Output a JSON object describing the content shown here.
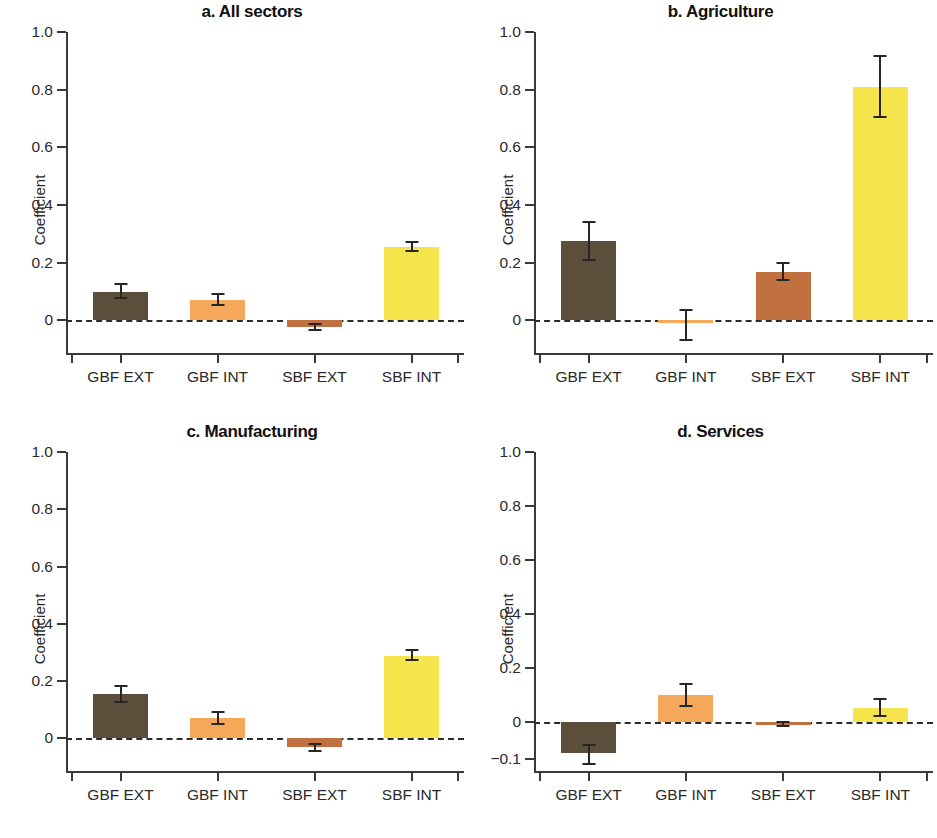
{
  "figure": {
    "ylabel": "Coefficient",
    "categories": [
      "GBF EXT",
      "GBF INT",
      "SBF EXT",
      "SBF INT"
    ],
    "colors": {
      "GBF EXT": "#5B4F3C",
      "GBF INT": "#F5A85A",
      "SBF EXT": "#C1713F",
      "SBF INT": "#F5E44C"
    }
  },
  "panels": [
    {
      "title": "a. All sectors",
      "ylabel": "Coefficient",
      "yticks": [
        "1.0",
        "0.8",
        "0.6",
        "0.4",
        "0.2",
        "0"
      ],
      "ytick_values": [
        1.0,
        0.8,
        0.6,
        0.4,
        0.2,
        0
      ],
      "ylim": [
        -0.06,
        1.0
      ]
    },
    {
      "title": "b. Agriculture",
      "ylabel": "Coefficient",
      "yticks": [
        "1.0",
        "0.8",
        "0.6",
        "0.4",
        "0.2",
        "0"
      ],
      "ytick_values": [
        1.0,
        0.8,
        0.6,
        0.4,
        0.2,
        0
      ],
      "ylim": [
        -0.085,
        1.0
      ]
    },
    {
      "title": "c. Manufacturing",
      "ylabel": "Coefficient",
      "yticks": [
        "1.0",
        "0.8",
        "0.6",
        "0.4",
        "0.2",
        "0"
      ],
      "ytick_values": [
        1.0,
        0.8,
        0.6,
        0.4,
        0.2,
        0
      ],
      "ylim": [
        -0.06,
        1.0
      ]
    },
    {
      "title": "d. Services",
      "ylabel": "Coefficient",
      "yticks": [
        "1.0",
        "0.8",
        "0.6",
        "0.4",
        "0.2",
        "0",
        "−0.1"
      ],
      "ytick_values": [
        1.0,
        0.8,
        0.6,
        0.4,
        0.2,
        0,
        -0.1
      ],
      "ylim": [
        -0.135,
        1.0
      ]
    }
  ],
  "chart_data": [
    {
      "type": "bar",
      "title": "a. All sectors",
      "xlabel": "",
      "ylabel": "Coefficient",
      "ylim": [
        -0.06,
        1.0
      ],
      "ytick_values": [
        1.0,
        0.8,
        0.6,
        0.4,
        0.2,
        0
      ],
      "grid": false,
      "legend": "none",
      "categories": [
        "GBF EXT",
        "GBF INT",
        "SBF EXT",
        "SBF INT"
      ],
      "values": [
        0.099,
        0.071,
        -0.012,
        0.255
      ],
      "errors_low": [
        0.076,
        0.054,
        -0.018,
        0.24
      ],
      "errors_high": [
        0.126,
        0.09,
        -0.006,
        0.271
      ]
    },
    {
      "type": "bar",
      "title": "b. Agriculture",
      "xlabel": "",
      "ylabel": "Coefficient",
      "ylim": [
        -0.085,
        1.0
      ],
      "ytick_values": [
        1.0,
        0.8,
        0.6,
        0.4,
        0.2,
        0
      ],
      "grid": false,
      "legend": "none",
      "categories": [
        "GBF EXT",
        "GBF INT",
        "SBF EXT",
        "SBF INT"
      ],
      "values": [
        0.274,
        -0.008,
        0.166,
        0.81
      ],
      "errors_low": [
        0.21,
        -0.05,
        0.138,
        0.705
      ],
      "errors_high": [
        0.342,
        0.035,
        0.198,
        0.918
      ]
    },
    {
      "type": "bar",
      "title": "c. Manufacturing",
      "xlabel": "",
      "ylabel": "Coefficient",
      "ylim": [
        -0.06,
        1.0
      ],
      "ytick_values": [
        1.0,
        0.8,
        0.6,
        0.4,
        0.2,
        0
      ],
      "grid": false,
      "legend": "none",
      "categories": [
        "GBF EXT",
        "GBF INT",
        "SBF EXT",
        "SBF INT"
      ],
      "values": [
        0.155,
        0.071,
        -0.016,
        0.289
      ],
      "errors_low": [
        0.128,
        0.052,
        -0.022,
        0.272
      ],
      "errors_high": [
        0.183,
        0.091,
        -0.01,
        0.307
      ]
    },
    {
      "type": "bar",
      "title": "d. Services",
      "xlabel": "",
      "ylabel": "Coefficient",
      "ylim": [
        -0.135,
        1.0
      ],
      "ytick_values": [
        1.0,
        0.8,
        0.6,
        0.4,
        0.2,
        0,
        -0.1
      ],
      "grid": false,
      "legend": "none",
      "categories": [
        "GBF EXT",
        "GBF INT",
        "SBF EXT",
        "SBF INT"
      ],
      "values": [
        -0.083,
        0.101,
        -0.005,
        0.055
      ],
      "errors_low": [
        -0.113,
        0.062,
        -0.01,
        0.024
      ],
      "errors_high": [
        -0.062,
        0.141,
        0.0,
        0.086
      ]
    }
  ]
}
